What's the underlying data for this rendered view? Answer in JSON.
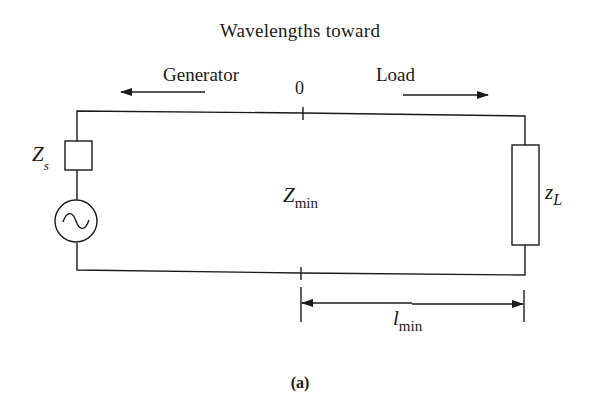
{
  "diagram": {
    "title": "Wavelengths toward",
    "direction_left": "Generator",
    "direction_right": "Load",
    "origin_label": "0",
    "source_impedance": {
      "symbol": "Z",
      "subscript": "s"
    },
    "source": {
      "type": "ac-voltage-source",
      "icon": "sine-wave-icon"
    },
    "line_point_impedance": {
      "symbol": "Z",
      "subscript": "min"
    },
    "load_impedance": {
      "symbol": "z",
      "subscript": "L"
    },
    "distance": {
      "symbol": "l",
      "subscript": "min"
    },
    "caption": "(a)",
    "colors": {
      "stroke": "#1a1a1a",
      "background": "#ffffff"
    }
  }
}
